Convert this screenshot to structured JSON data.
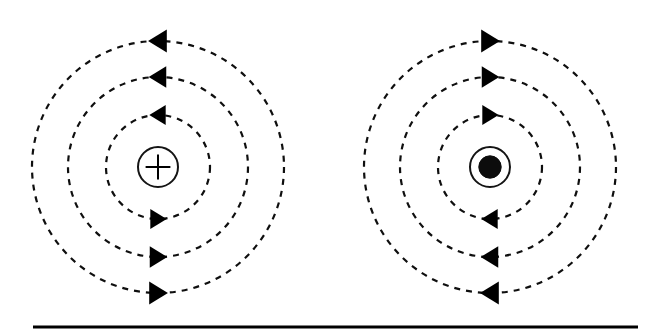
{
  "figure": {
    "background_color": "#ffffff",
    "line_color": "#000000",
    "width": 645,
    "height": 335,
    "caption_rule": {
      "x1": 33,
      "x2": 638,
      "y": 327,
      "thickness": 3,
      "color": "#000000"
    }
  },
  "diagrams": [
    {
      "id": "left-diagram",
      "name": "current-into-page-diagram",
      "center": {
        "x": 158,
        "y": 167
      },
      "charge_symbol": "plus",
      "charge_symbol_label": "+",
      "charge_ring_radius": 20,
      "charge_ring_stroke": 2,
      "field_direction": "clockwise",
      "field_circles": [
        {
          "radius": 52,
          "dash": "6 6",
          "stroke": 2.2
        },
        {
          "radius": 90,
          "dash": "6 6",
          "stroke": 2.2
        },
        {
          "radius": 126,
          "dash": "6 6",
          "stroke": 2.2
        }
      ],
      "arrows": [
        {
          "name": "arrow-top-inner",
          "x": 158,
          "y": 115,
          "direction": "left",
          "size": 14
        },
        {
          "name": "arrow-top-middle",
          "x": 158,
          "y": 77,
          "direction": "left",
          "size": 15
        },
        {
          "name": "arrow-top-outer",
          "x": 158,
          "y": 41,
          "direction": "left",
          "size": 16
        },
        {
          "name": "arrow-bottom-inner",
          "x": 158,
          "y": 219,
          "direction": "right",
          "size": 14
        },
        {
          "name": "arrow-bottom-middle",
          "x": 158,
          "y": 257,
          "direction": "right",
          "size": 15
        },
        {
          "name": "arrow-bottom-outer",
          "x": 158,
          "y": 293,
          "direction": "right",
          "size": 16
        }
      ]
    },
    {
      "id": "right-diagram",
      "name": "current-out-of-page-diagram",
      "center": {
        "x": 490,
        "y": 167
      },
      "charge_symbol": "dot",
      "charge_symbol_label": "⊙",
      "charge_ring_radius": 20,
      "charge_ring_stroke": 2,
      "field_direction": "counter-clockwise",
      "field_circles": [
        {
          "radius": 52,
          "dash": "6 6",
          "stroke": 2.2
        },
        {
          "radius": 90,
          "dash": "6 6",
          "stroke": 2.2
        },
        {
          "radius": 126,
          "dash": "6 6",
          "stroke": 2.2
        }
      ],
      "arrows": [
        {
          "name": "arrow-top-inner",
          "x": 490,
          "y": 115,
          "direction": "right",
          "size": 14
        },
        {
          "name": "arrow-top-middle",
          "x": 490,
          "y": 77,
          "direction": "right",
          "size": 15
        },
        {
          "name": "arrow-top-outer",
          "x": 490,
          "y": 41,
          "direction": "right",
          "size": 16
        },
        {
          "name": "arrow-bottom-inner",
          "x": 490,
          "y": 219,
          "direction": "left",
          "size": 14
        },
        {
          "name": "arrow-bottom-middle",
          "x": 490,
          "y": 257,
          "direction": "left",
          "size": 15
        },
        {
          "name": "arrow-bottom-outer",
          "x": 490,
          "y": 293,
          "direction": "left",
          "size": 16
        }
      ]
    }
  ]
}
